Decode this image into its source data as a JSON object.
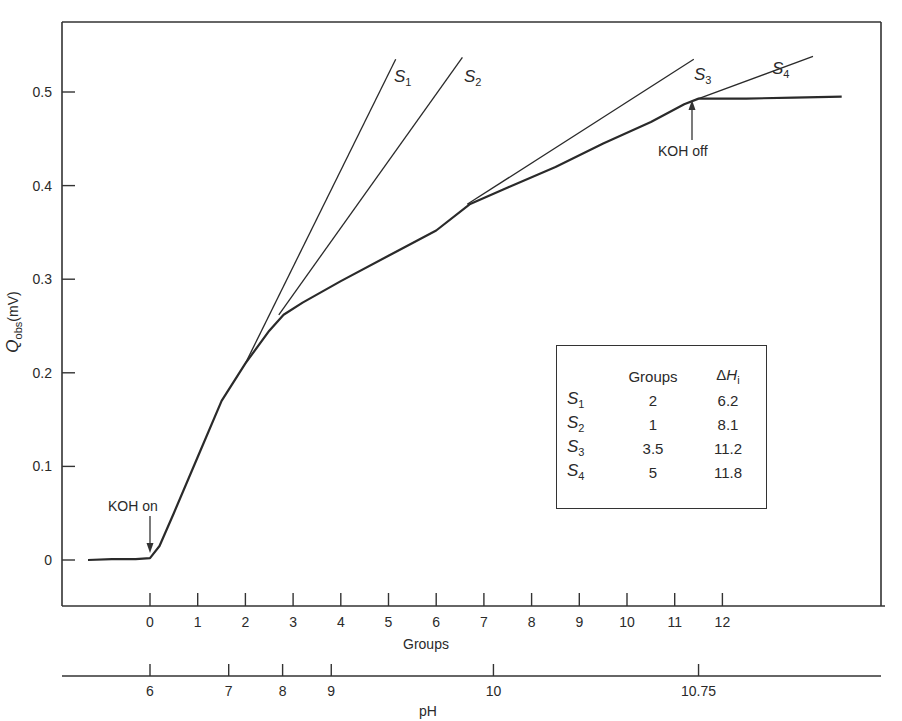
{
  "chart_data": {
    "type": "line",
    "title": "",
    "ylabel": "Q_obs (mV)",
    "xlabel": "Groups",
    "x2label": "pH",
    "ylim": [
      -0.05,
      0.57
    ],
    "xlim": [
      -1.8,
      15.6
    ],
    "grid": false,
    "y_ticks": [
      "0",
      "0.1",
      "0.2",
      "0.3",
      "0.4",
      "0.5"
    ],
    "x_ticks": [
      "0",
      "1",
      "2",
      "3",
      "4",
      "5",
      "6",
      "7",
      "8",
      "9",
      "10",
      "11",
      "12"
    ],
    "x2_ticks": [
      "6",
      "7",
      "8",
      "9",
      "10",
      "10.75"
    ],
    "x2_tick_positions_groups": [
      0,
      1.65,
      2.78,
      3.8,
      7.2,
      11.5
    ],
    "series": [
      {
        "name": "Q_obs titration curve",
        "x": [
          -1.3,
          -0.8,
          -0.3,
          0.0,
          0.2,
          0.5,
          1.0,
          1.5,
          2.0,
          2.5,
          2.8,
          3.2,
          4.0,
          5.0,
          6.0,
          6.7,
          7.5,
          8.5,
          9.5,
          10.5,
          11.2,
          11.5,
          12.5,
          13.5,
          14.5
        ],
        "y": [
          0.0,
          0.001,
          0.001,
          0.002,
          0.015,
          0.05,
          0.11,
          0.17,
          0.21,
          0.245,
          0.262,
          0.275,
          0.298,
          0.325,
          0.352,
          0.38,
          0.398,
          0.42,
          0.445,
          0.468,
          0.487,
          0.493,
          0.493,
          0.494,
          0.495
        ]
      },
      {
        "name": "S1",
        "x": [
          2.0,
          5.15
        ],
        "y": [
          0.21,
          0.535
        ]
      },
      {
        "name": "S2",
        "x": [
          2.7,
          6.55
        ],
        "y": [
          0.262,
          0.537
        ]
      },
      {
        "name": "S3",
        "x": [
          6.65,
          11.4
        ],
        "y": [
          0.38,
          0.535
        ]
      },
      {
        "name": "S4",
        "x": [
          11.5,
          13.9
        ],
        "y": [
          0.493,
          0.538
        ]
      }
    ],
    "annotations": [
      {
        "text": "KOH on",
        "x": 0,
        "y": 0.002,
        "arrow": "down"
      },
      {
        "text": "KOH off",
        "x": 11.5,
        "y": 0.493,
        "arrow": "up"
      }
    ],
    "legend_table": {
      "headers": [
        "",
        "Groups",
        "ΔHi"
      ],
      "rows": [
        {
          "label": "S",
          "sub": "1",
          "groups": "2",
          "dh": "6.2"
        },
        {
          "label": "S",
          "sub": "2",
          "groups": "1",
          "dh": "8.1"
        },
        {
          "label": "S",
          "sub": "3",
          "groups": "3.5",
          "dh": "11.2"
        },
        {
          "label": "S",
          "sub": "4",
          "groups": "5",
          "dh": "11.8"
        }
      ],
      "position": "lower-right inside plot"
    }
  },
  "labels": {
    "ylabel_main": "Q",
    "ylabel_sub": "obs",
    "ylabel_unit": "(mV)",
    "xlabel": "Groups",
    "x2label": "pH",
    "koh_on": "KOH on",
    "koh_off": "KOH off",
    "s1": "S",
    "s1_sub": "1",
    "s2": "S",
    "s2_sub": "2",
    "s3": "S",
    "s3_sub": "3",
    "s4": "S",
    "s4_sub": "4"
  }
}
